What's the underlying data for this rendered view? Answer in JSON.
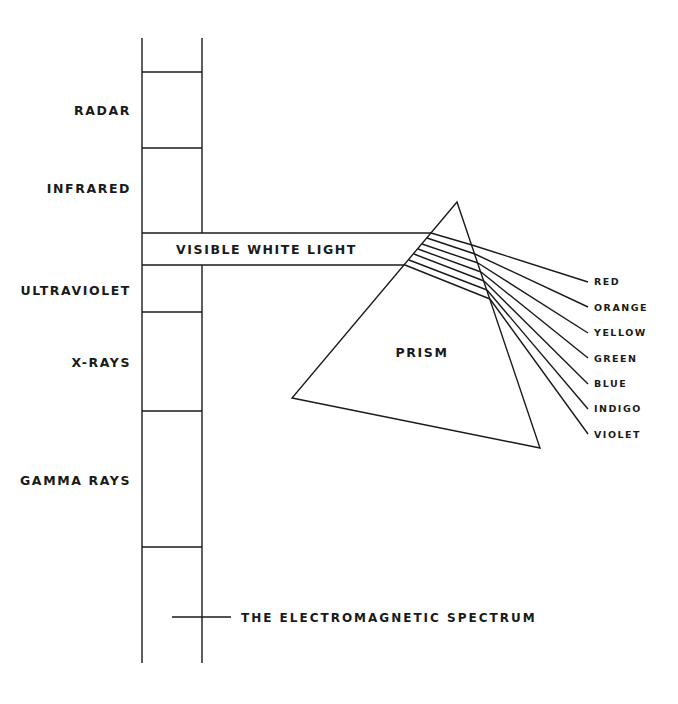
{
  "diagram": {
    "title": "THE ELECTROMAGNETIC SPECTRUM",
    "bands": [
      {
        "label": "RADAR"
      },
      {
        "label": "INFRARED"
      },
      {
        "label": "VISIBLE WHITE LIGHT"
      },
      {
        "label": "ULTRAVIOLET"
      },
      {
        "label": "X-RAYS"
      },
      {
        "label": "GAMMA RAYS"
      }
    ],
    "prism": {
      "label": "PRISM"
    },
    "colors": [
      {
        "label": "RED"
      },
      {
        "label": "ORANGE"
      },
      {
        "label": "YELLOW"
      },
      {
        "label": "GREEN"
      },
      {
        "label": "BLUE"
      },
      {
        "label": "INDIGO"
      },
      {
        "label": "VIOLET"
      }
    ],
    "line_color": "#1a1a1a",
    "background": "#ffffff"
  }
}
